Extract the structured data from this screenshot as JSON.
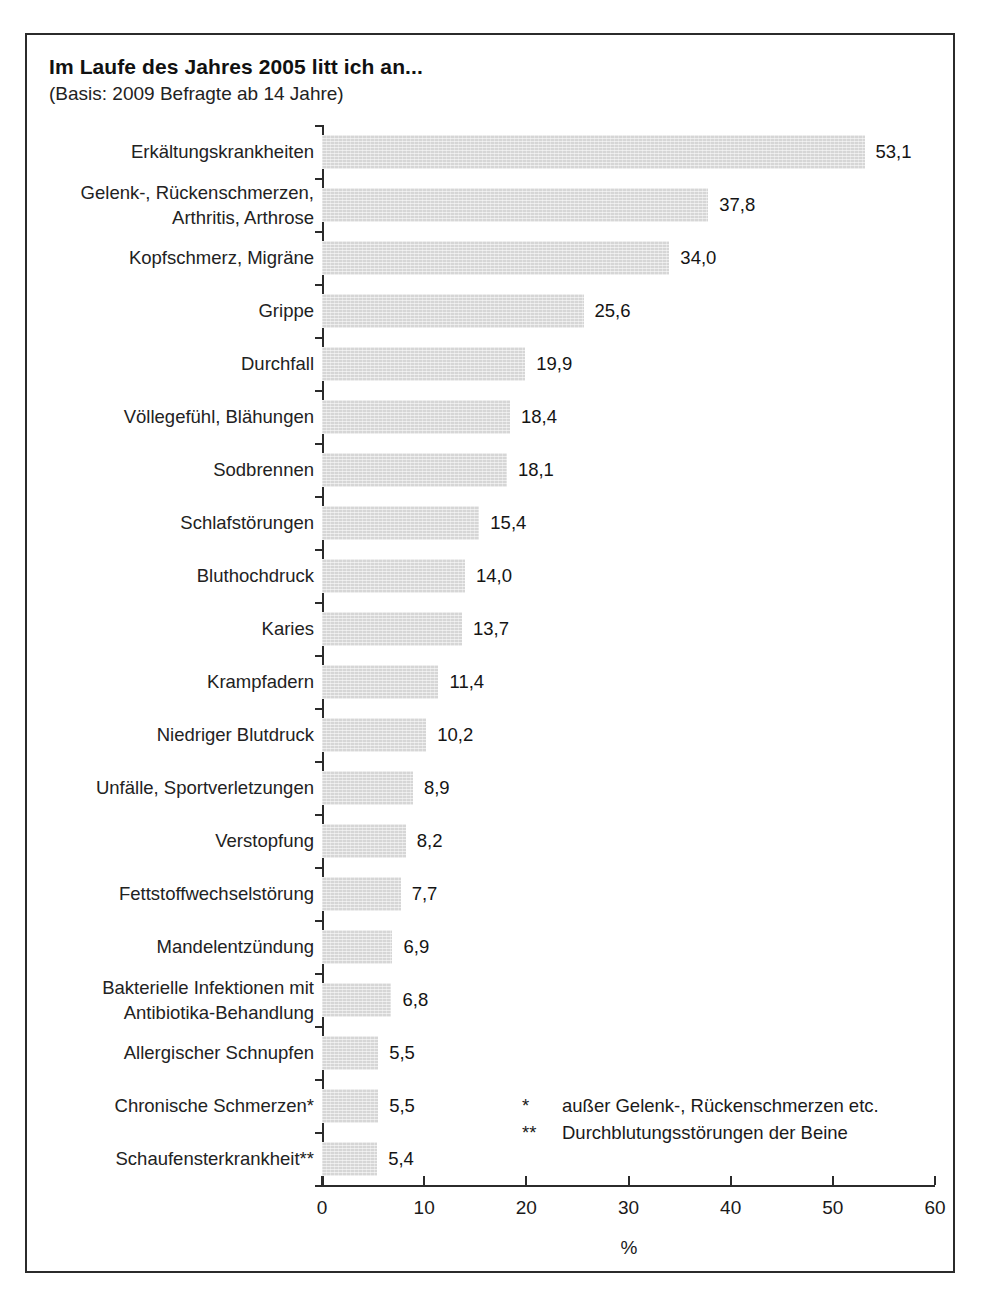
{
  "header": {
    "title": "Im Laufe des Jahres 2005 litt ich an...",
    "subtitle": "(Basis: 2009 Befragte ab 14 Jahre)"
  },
  "footnotes": [
    {
      "mark": "*",
      "text": "außer Gelenk-, Rückenschmerzen etc."
    },
    {
      "mark": "**",
      "text": "Durchblutungsstörungen der Beine"
    }
  ],
  "chart_data": {
    "type": "bar",
    "orientation": "horizontal",
    "title": "Im Laufe des Jahres 2005 litt ich an...",
    "subtitle": "(Basis: 2009 Befragte ab 14 Jahre)",
    "xlabel": "%",
    "ylabel": "",
    "xlim": [
      0,
      60
    ],
    "xticks": [
      0,
      10,
      20,
      30,
      40,
      50,
      60
    ],
    "xtick_labels": [
      "0",
      "10",
      "20",
      "30",
      "40",
      "50",
      "60"
    ],
    "grid": false,
    "legend": false,
    "bar_color": "#d6d6d6",
    "categories": [
      "Erkältungskrankheiten",
      "Gelenk-, Rückenschmerzen,\nArthritis, Arthrose",
      "Kopfschmerz, Migräne",
      "Grippe",
      "Durchfall",
      "Völlegefühl, Blähungen",
      "Sodbrennen",
      "Schlafstörungen",
      "Bluthochdruck",
      "Karies",
      "Krampfadern",
      "Niedriger Blutdruck",
      "Unfälle, Sportverletzungen",
      "Verstopfung",
      "Fettstoffwechselstörung",
      "Mandelentzündung",
      "Bakterielle Infektionen mit\nAntibiotika-Behandlung",
      "Allergischer Schnupfen",
      "Chronische Schmerzen*",
      "Schaufensterkrankheit**"
    ],
    "values": [
      53.1,
      37.8,
      34.0,
      25.6,
      19.9,
      18.4,
      18.1,
      15.4,
      14.0,
      13.7,
      11.4,
      10.2,
      8.9,
      8.2,
      7.7,
      6.9,
      6.8,
      5.5,
      5.5,
      5.4
    ],
    "value_labels": [
      "53,1",
      "37,8",
      "34,0",
      "25,6",
      "19,9",
      "18,4",
      "18,1",
      "15,4",
      "14,0",
      "13,7",
      "11,4",
      "10,2",
      "8,9",
      "8,2",
      "7,7",
      "6,9",
      "6,8",
      "5,5",
      "5,5",
      "5,4"
    ]
  }
}
